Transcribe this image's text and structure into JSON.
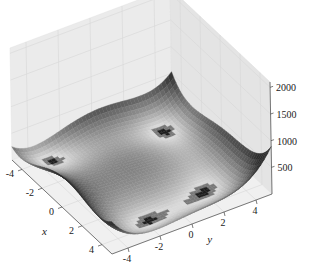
{
  "chart_data": {
    "type": "surface3d",
    "title": "",
    "function": "Himmelblau: f(x,y) = (x^2 + y - 11)^2 + (x + y^2 - 7)^2",
    "colormap": "grayscale (dark = high, light = low)",
    "xlabel": "x",
    "ylabel": "y",
    "zlabel": "",
    "x_ticks": [
      "-4",
      "-2",
      "0",
      "2",
      "4"
    ],
    "y_ticks": [
      "-4",
      "-2",
      "0",
      "2",
      "4"
    ],
    "z_ticks": [
      "500",
      "1000",
      "1500",
      "2000"
    ],
    "xlim": [
      -5,
      5
    ],
    "ylim": [
      -5,
      5
    ],
    "zlim": [
      0,
      2100
    ],
    "minima": [
      {
        "x": 3.0,
        "y": 2.0,
        "z": 0
      },
      {
        "x": -2.805,
        "y": 3.131,
        "z": 0
      },
      {
        "x": -3.779,
        "y": -3.283,
        "z": 0
      },
      {
        "x": 3.584,
        "y": -1.848,
        "z": 0
      }
    ],
    "grid": true,
    "pane_color": "#ececec",
    "grid_color": "#d6d6d6"
  }
}
